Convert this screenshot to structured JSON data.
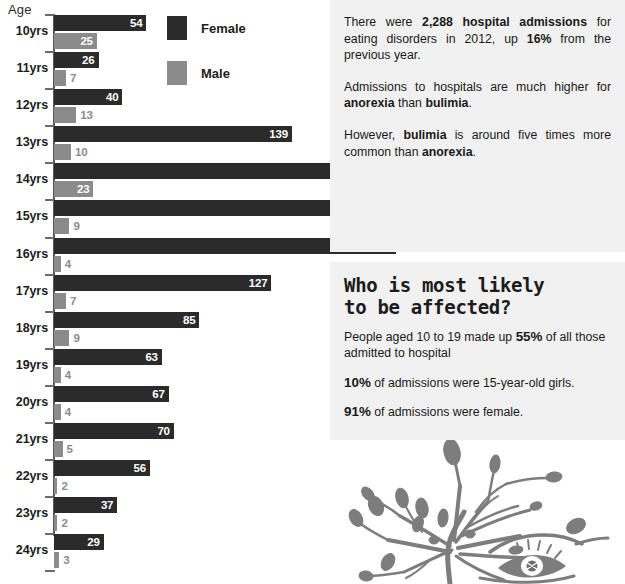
{
  "chart_data": {
    "type": "bar",
    "orientation": "horizontal",
    "title": "",
    "xlabel": "",
    "ylabel": "Age",
    "axis_label": "Age",
    "categories": [
      "10yrs",
      "11yrs",
      "12yrs",
      "13yrs",
      "14yrs",
      "15yrs",
      "16yrs",
      "17yrs",
      "18yrs",
      "19yrs",
      "20yrs",
      "21yrs",
      "22yrs",
      "23yrs",
      "24yrs"
    ],
    "series": [
      {
        "name": "Female",
        "color": "#2b2b2b",
        "values": [
          54,
          26,
          40,
          139,
          185,
          222,
          200,
          127,
          85,
          63,
          67,
          70,
          56,
          37,
          29
        ]
      },
      {
        "name": "Male",
        "color": "#8b8b8b",
        "values": [
          25,
          7,
          13,
          10,
          23,
          9,
          4,
          7,
          9,
          4,
          4,
          5,
          2,
          2,
          3
        ]
      }
    ],
    "xlim": [
      0,
      222
    ],
    "grid": false,
    "legend_position": "top-right",
    "legend": [
      "Female",
      "Male"
    ]
  },
  "chart": {
    "axis_label": "Age",
    "legend": [
      {
        "label": "Female",
        "color": "#2b2b2b"
      },
      {
        "label": "Male",
        "color": "#8b8b8b"
      }
    ],
    "rows": [
      {
        "age": "10yrs",
        "female": 54,
        "male": 25
      },
      {
        "age": "11yrs",
        "female": 26,
        "male": 7
      },
      {
        "age": "12yrs",
        "female": 40,
        "male": 13
      },
      {
        "age": "13yrs",
        "female": 139,
        "male": 10
      },
      {
        "age": "14yrs",
        "female": 185,
        "male": 23
      },
      {
        "age": "15yrs",
        "female": 222,
        "male": 9
      },
      {
        "age": "16yrs",
        "female": 200,
        "male": 4
      },
      {
        "age": "17yrs",
        "female": 127,
        "male": 7
      },
      {
        "age": "18yrs",
        "female": 85,
        "male": 9
      },
      {
        "age": "19yrs",
        "female": 63,
        "male": 4
      },
      {
        "age": "20yrs",
        "female": 67,
        "male": 4
      },
      {
        "age": "21yrs",
        "female": 70,
        "male": 5
      },
      {
        "age": "22yrs",
        "female": 56,
        "male": 2
      },
      {
        "age": "23yrs",
        "female": 37,
        "male": 2
      },
      {
        "age": "24yrs",
        "female": 29,
        "male": 3
      }
    ]
  },
  "stats_panel": {
    "paragraph_1": {
      "before": "There were ",
      "bold_1": "2,288 hospital admissions",
      "middle": " for eating disorders in 2012, up ",
      "bold_2": "16%",
      "after": " from the previous year."
    },
    "paragraph_2": {
      "before": "Admissions to hospitals are much higher for ",
      "bold_1": "anorexia",
      "middle": " than ",
      "bold_2": "bulimia",
      "after": "."
    },
    "paragraph_3": {
      "before": "However, ",
      "bold_1": "bulimia",
      "middle": " is around five times more common than ",
      "bold_2": "anorexia",
      "after": "."
    }
  },
  "who_panel": {
    "heading_line_1": "Who is most likely",
    "heading_line_2": "to be affected?",
    "line_1": {
      "before": "People aged 10 to 19 made up ",
      "bold": "55%",
      "after": " of all those admitted to hospital"
    },
    "line_2": {
      "bold": "10%",
      "after": " of admissions were 15-year-old girls."
    },
    "line_3": {
      "bold": "91%",
      "after": " of  admissions were female."
    }
  },
  "illustration": {
    "name": "branches-and-eye-illustration",
    "color": "#7d7d7d"
  },
  "colors": {
    "female_bar": "#2b2b2b",
    "male_bar": "#8b8b8b",
    "panel_background": "#f1f1f1",
    "page_background": "#ffffff"
  }
}
